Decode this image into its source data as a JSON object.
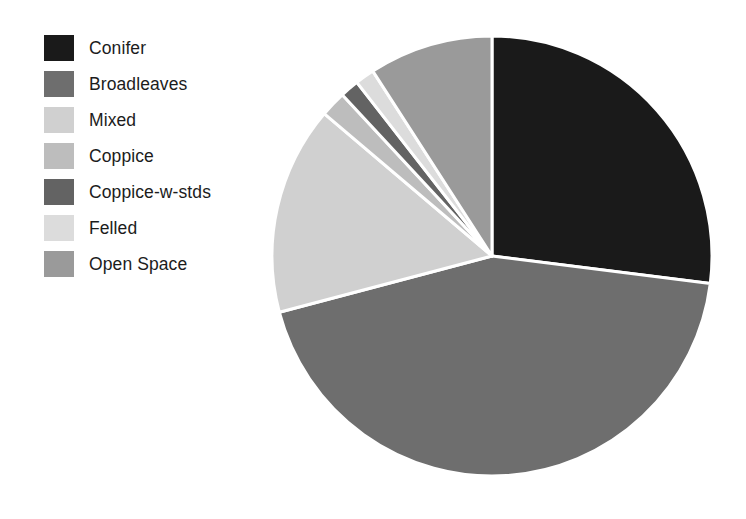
{
  "chart_data": {
    "type": "pie",
    "title": "",
    "subtitle": "",
    "xlabel": "",
    "ylabel": "",
    "legend_position": "left",
    "grid": false,
    "start_angle_deg": 0,
    "direction": "clockwise",
    "categories": [
      "Conifer",
      "Broadleaves",
      "Mixed",
      "Coppice",
      "Coppice-w-stds",
      "Felled",
      "Open Space"
    ],
    "values": [
      27.0,
      43.9,
      15.3,
      1.9,
      1.4,
      1.4,
      9.1
    ],
    "units": "percent",
    "colors": [
      "#1a1a1a",
      "#6e6e6e",
      "#d0d0d0",
      "#bdbdbd",
      "#636363",
      "#dcdcdc",
      "#9a9a9a"
    ],
    "slices": [
      {
        "label": "Conifer",
        "value": 27.0,
        "color": "#1a1a1a",
        "start_deg": 0.0,
        "end_deg": 97.2
      },
      {
        "label": "Broadleaves",
        "value": 43.9,
        "color": "#6e6e6e",
        "start_deg": 97.2,
        "end_deg": 255.2
      },
      {
        "label": "Mixed",
        "value": 15.3,
        "color": "#d0d0d0",
        "start_deg": 255.2,
        "end_deg": 310.3
      },
      {
        "label": "Coppice",
        "value": 1.9,
        "color": "#bdbdbd",
        "start_deg": 310.3,
        "end_deg": 317.1
      },
      {
        "label": "Coppice-w-stds",
        "value": 1.4,
        "color": "#636363",
        "start_deg": 317.1,
        "end_deg": 322.1
      },
      {
        "label": "Felled",
        "value": 1.4,
        "color": "#dcdcdc",
        "start_deg": 322.1,
        "end_deg": 327.2
      },
      {
        "label": "Open Space",
        "value": 9.1,
        "color": "#9a9a9a",
        "start_deg": 327.2,
        "end_deg": 360.0
      }
    ]
  },
  "legend": {
    "items": [
      {
        "label": "Conifer",
        "color": "#1a1a1a"
      },
      {
        "label": "Broadleaves",
        "color": "#6e6e6e"
      },
      {
        "label": "Mixed",
        "color": "#d0d0d0"
      },
      {
        "label": "Coppice",
        "color": "#bdbdbd"
      },
      {
        "label": "Coppice-w-stds",
        "color": "#636363"
      },
      {
        "label": "Felled",
        "color": "#dcdcdc"
      },
      {
        "label": "Open Space",
        "color": "#9a9a9a"
      }
    ]
  },
  "figure": {
    "background": "#ffffff",
    "slice_border_color": "#ffffff"
  }
}
